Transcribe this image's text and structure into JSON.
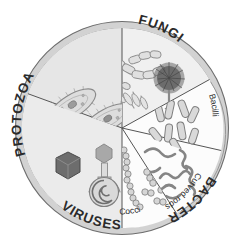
{
  "figure": {
    "shape": "circle"
  },
  "colors": {
    "background": "#ffffff",
    "outer_ring": "#d2d2d2",
    "outer_ring_stroke": "#6e6e6e",
    "sector_protozoa": "#ebebeb",
    "sector_fungi": "#f2f2f2",
    "sector_bacilli": "#fbfbfb",
    "sector_curved_rods": "#fbfbfb",
    "sector_cocci": "#fbfbfb",
    "sector_viruses": "#ededed",
    "divider": "#555555",
    "organism_outline": "#8a8a8a",
    "organism_fill": "#d8d8d8",
    "virus_dark": "#6d6d6d",
    "fungus_spore_head": "#5a5a5a",
    "label_text": "#2b2b2b"
  },
  "ring_labels": [
    {
      "id": "protozoa",
      "text": "PROTOZOA"
    },
    {
      "id": "fungi",
      "text": "FUNGI"
    },
    {
      "id": "bacteria",
      "text": "BACTERIA"
    },
    {
      "id": "viruses",
      "text": "VIRUSES"
    }
  ],
  "sub_labels": [
    {
      "id": "bacilli",
      "text": "Bacilli"
    },
    {
      "id": "curved-rods",
      "text": "Curved rods"
    },
    {
      "id": "cocci",
      "text": "Cocci"
    }
  ],
  "sectors": [
    {
      "id": "protozoa",
      "label": "PROTOZOA",
      "contents": "Two paramecium-like ciliated protozoa with internal organelles"
    },
    {
      "id": "fungi",
      "label": "FUNGI",
      "contents": "Branching septate hyphae, budding yeast cells and a dark spore head (conidiophore)"
    },
    {
      "id": "bacilli",
      "label": "Bacilli",
      "contents": "Scattered rod-shaped bacteria"
    },
    {
      "id": "curved-rods",
      "label": "Curved rods",
      "contents": "Comma-shaped vibrios, spirilla and spirochaetes"
    },
    {
      "id": "cocci",
      "label": "Cocci",
      "contents": "Streptococcus chains, staphylococcus clusters, diplococci and single cocci"
    },
    {
      "id": "viruses",
      "label": "VIRUSES",
      "contents": "Icosahedral capsid, bacteriophage with tail fibres and a coiled helical virus"
    }
  ]
}
